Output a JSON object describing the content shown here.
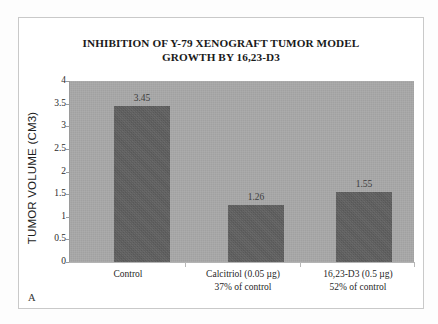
{
  "panel_letter": "A",
  "chart_data": {
    "type": "bar",
    "title": "INHIBITION OF Y-79 XENOGRAFT TUMOR MODEL GROWTH BY 16,23-D3",
    "title_lines": [
      "INHIBITION OF Y-79 XENOGRAFT TUMOR MODEL",
      "GROWTH BY 16,23-D3"
    ],
    "xlabel": "",
    "ylabel": "TUMOR VOLUME (CM3)",
    "ylim": [
      0,
      4
    ],
    "ytick_values": [
      0,
      0.5,
      1,
      1.5,
      2,
      2.5,
      3,
      3.5,
      4
    ],
    "ytick_labels": [
      "0",
      "0.5",
      "1",
      "1.5",
      "2",
      "2.5",
      "3",
      "3.5",
      "4"
    ],
    "grid": false,
    "legend": false,
    "categories": [
      "Control",
      "Calcitriol (0.05 µg)",
      "16,23-D3 (0.5 µg)"
    ],
    "category_sublabels": [
      "",
      "37% of control",
      "52% of control"
    ],
    "values": [
      3.45,
      1.26,
      1.55
    ],
    "value_labels": [
      "3.45",
      "1.26",
      "1.55"
    ],
    "bars": [
      {
        "label": "Control",
        "sublabel": "",
        "value": 3.45,
        "value_label": "3.45"
      },
      {
        "label": "Calcitriol (0.05 µg)",
        "sublabel": "37% of control",
        "value": 1.26,
        "value_label": "1.26"
      },
      {
        "label": "16,23-D3 (0.5 µg)",
        "sublabel": "52% of control",
        "value": 1.55,
        "value_label": "1.55"
      }
    ],
    "colors": {
      "bar": "#5f5f5f",
      "plot_background": "#a9a9a9",
      "figure_background": "#ffffff",
      "text": "#1a1a1a",
      "axis": "#9a9a9a"
    }
  }
}
